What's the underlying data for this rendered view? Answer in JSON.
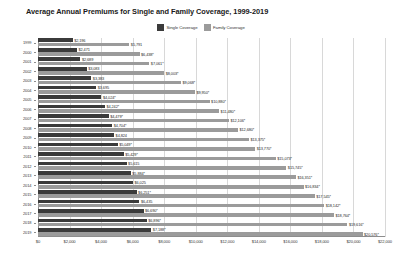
{
  "chart_data": {
    "type": "bar",
    "title": "Average Annual Premiums for Single and Family Coverage, 1999-2019",
    "xlabel": "",
    "ylabel": "",
    "orientation": "horizontal",
    "grid": true,
    "legend_position": "top-center",
    "xlim": [
      0,
      22000
    ],
    "xticks": [
      0,
      2000,
      4000,
      6000,
      8000,
      10000,
      12000,
      14000,
      16000,
      18000,
      20000,
      22000
    ],
    "xtick_labels": [
      "$0",
      "$2,000",
      "$4,000",
      "$6,000",
      "$8,000",
      "$10,000",
      "$12,000",
      "$14,000",
      "$16,000",
      "$18,000",
      "$20,000",
      "$22,000"
    ],
    "categories": [
      "1999",
      "2000",
      "2001",
      "2002",
      "2003",
      "2004",
      "2005",
      "2006",
      "2007",
      "2008",
      "2009",
      "2010",
      "2011",
      "2012",
      "2013",
      "2014",
      "2015",
      "2016",
      "2017",
      "2018",
      "2019"
    ],
    "series": [
      {
        "name": "Single Coverage",
        "color": "#3b3b3b",
        "values": [
          2196,
          2471,
          2689,
          3083,
          3383,
          3695,
          4024,
          4242,
          4479,
          4704,
          4824,
          5049,
          5429,
          5615,
          5884,
          6025,
          6251,
          6435,
          6690,
          6896,
          7188
        ],
        "labels": [
          "$2,196",
          "$2,471",
          "$2,689",
          "$3,083",
          "$3,383",
          "$3,695",
          "$4,024*",
          "$4,242*",
          "$4,479*",
          "$4,704*",
          "$4,824",
          "$5,049*",
          "$5,429*",
          "$5,615",
          "$5,884*",
          "$6,025",
          "$6,251*",
          "$6,435",
          "$6,690*",
          "$6,896*",
          "$7,188*"
        ]
      },
      {
        "name": "Family Coverage",
        "color": "#9b9b9b",
        "values": [
          5791,
          6438,
          7061,
          8003,
          9068,
          9950,
          10880,
          11480,
          12106,
          12680,
          13375,
          13770,
          15073,
          15745,
          16351,
          16834,
          17545,
          18142,
          18764,
          19616,
          20576
        ],
        "labels": [
          "$5,791",
          "$6,438*",
          "$7,061*",
          "$8,003*",
          "$9,068*",
          "$9,950*",
          "$10,880*",
          "$11,480*",
          "$12,106*",
          "$12,680*",
          "$13,375*",
          "$13,770*",
          "$15,073*",
          "$15,745*",
          "$16,351*",
          "$16,834*",
          "$17,545*",
          "$18,142*",
          "$18,764*",
          "$19,616*",
          "$20,576*"
        ]
      }
    ]
  },
  "legend": {
    "items": [
      {
        "label": "Single Coverage",
        "color": "#3b3b3b"
      },
      {
        "label": "Family Coverage",
        "color": "#9b9b9b"
      }
    ]
  }
}
